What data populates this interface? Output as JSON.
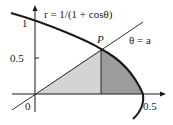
{
  "diagram": {
    "curve_label": "r = 1/(1 + cosθ)",
    "ray_label": "θ = a",
    "point_label": "P",
    "x_axis": {
      "tick_labels": [
        "0",
        "0.5"
      ]
    },
    "y_axis": {
      "tick_labels": [
        "1",
        "0.5"
      ]
    },
    "colors": {
      "light_region": "#d4d4d4",
      "dark_region": "#9c9c9c",
      "stroke": "#1a1a1a",
      "background": "#ffffff"
    }
  }
}
